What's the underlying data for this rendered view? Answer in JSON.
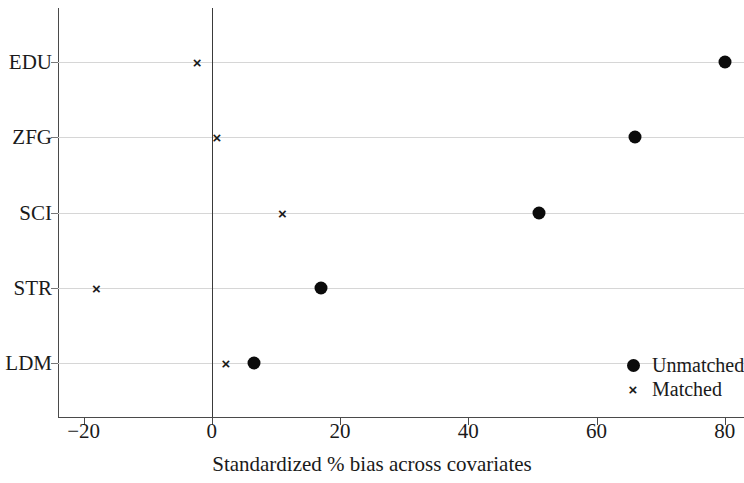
{
  "chart_data": {
    "type": "scatter",
    "title": "",
    "xlabel": "Standardized % bias across covariates",
    "ylabel": "",
    "categories": [
      "EDU",
      "ZFG",
      "SCI",
      "STR",
      "LDM"
    ],
    "series": [
      {
        "name": "Unmatched",
        "marker": "filled-circle",
        "values": [
          80,
          66,
          51,
          17,
          6.5
        ]
      },
      {
        "name": "Matched",
        "marker": "cross",
        "values": [
          -2.3,
          0.8,
          11,
          -18,
          2.2
        ]
      }
    ],
    "xlim": [
      -24,
      83
    ],
    "xticks": [
      -20,
      0,
      20,
      40,
      60,
      80
    ],
    "xtick_labels": [
      "−20",
      "0",
      "20",
      "40",
      "60",
      "80"
    ],
    "reference_line_x": 0,
    "grid": "horizontal",
    "legend_position": "bottom-right",
    "colors": {
      "marker": "#0b0b0b",
      "axis": "#4a4a4a",
      "grid": "#d6d6d6",
      "reference_line": "#3a3a3a",
      "text": "#1a1a1a",
      "background": "#ffffff"
    }
  },
  "legend": {
    "entries": [
      {
        "label": "Unmatched",
        "marker": "filled-circle"
      },
      {
        "label": "Matched",
        "marker": "cross"
      }
    ]
  },
  "glyphs": {
    "cross": "×"
  }
}
